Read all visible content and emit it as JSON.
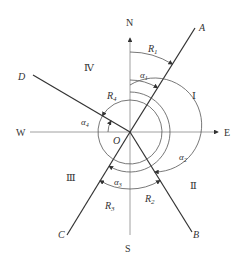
{
  "diagram": {
    "type": "azimuth-bearing",
    "origin": "O",
    "directions": {
      "north": "N",
      "south": "S",
      "east": "E",
      "west": "W"
    },
    "lines": [
      "A",
      "B",
      "C",
      "D"
    ],
    "quadrants": [
      "Ⅰ",
      "Ⅱ",
      "Ⅲ",
      "Ⅳ"
    ],
    "bearings": [
      {
        "label": "R",
        "sub": "1"
      },
      {
        "label": "R",
        "sub": "2"
      },
      {
        "label": "R",
        "sub": "3"
      },
      {
        "label": "R",
        "sub": "4"
      }
    ],
    "azimuths": [
      {
        "label": "α",
        "sub": "1"
      },
      {
        "label": "α",
        "sub": "2"
      },
      {
        "label": "α",
        "sub": "3"
      },
      {
        "label": "α",
        "sub": "4"
      }
    ],
    "colors": {
      "line": "#333333",
      "axis": "#888888",
      "background": "#ffffff"
    }
  }
}
